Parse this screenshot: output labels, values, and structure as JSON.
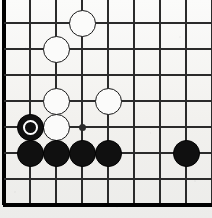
{
  "diagram": {
    "kind": "go-board-diagram",
    "board_size": 19,
    "view": "bottom-left corner",
    "geometry": {
      "origin_x": 4,
      "origin_y": -3,
      "spacing": 26,
      "columns": 9,
      "rows": 9,
      "edge_line_width": 3.2,
      "inner_line_width": 1.1,
      "stone_diameter": 27,
      "hoshi_diameter": 7
    },
    "colors": {
      "paper": "#f4f3f1",
      "line": "#2b2b2b",
      "edge_line": "#000000",
      "black_stone": "#101010",
      "white_stone": "#fbfbfa",
      "white_stone_border": "#1a1a1a",
      "mark": "#ffffff"
    },
    "edges": {
      "left_is_board_edge": true,
      "bottom_is_board_edge": true,
      "top_is_board_edge": false,
      "right_is_board_edge": false
    },
    "hoshi_points": [
      {
        "col": 3,
        "row": 5,
        "name": "star-point-4-4"
      }
    ],
    "stones": [
      {
        "col": 3,
        "row": 1,
        "color": "white",
        "mark": "none",
        "name": "white-stone-d1"
      },
      {
        "col": 2,
        "row": 2,
        "color": "white",
        "mark": "none",
        "name": "white-stone-c2"
      },
      {
        "col": 2,
        "row": 4,
        "color": "white",
        "mark": "none",
        "name": "white-stone-c4"
      },
      {
        "col": 4,
        "row": 4,
        "color": "white",
        "mark": "none",
        "name": "white-stone-e4"
      },
      {
        "col": 2,
        "row": 5,
        "color": "white",
        "mark": "none",
        "name": "white-stone-c5"
      },
      {
        "col": 1,
        "row": 5,
        "color": "black",
        "mark": "circle",
        "name": "black-stone-marked-b5"
      },
      {
        "col": 1,
        "row": 6,
        "color": "black",
        "mark": "none",
        "name": "black-stone-b6"
      },
      {
        "col": 2,
        "row": 6,
        "color": "black",
        "mark": "none",
        "name": "black-stone-c6"
      },
      {
        "col": 3,
        "row": 6,
        "color": "black",
        "mark": "none",
        "name": "black-stone-d6"
      },
      {
        "col": 4,
        "row": 6,
        "color": "black",
        "mark": "none",
        "name": "black-stone-e6"
      },
      {
        "col": 7,
        "row": 6,
        "color": "black",
        "mark": "none",
        "name": "black-stone-h6"
      }
    ]
  }
}
